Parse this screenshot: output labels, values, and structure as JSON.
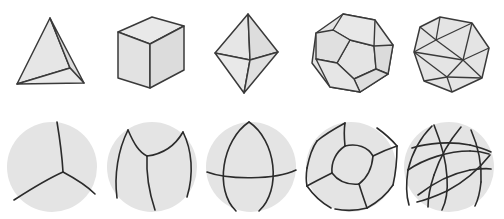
{
  "figure": {
    "background_color": "#ffffff",
    "rows": [
      {
        "name": "polyhedra-row",
        "description": "Convex regular polyhedra drawn in oblique projection",
        "items": [
          {
            "name": "tetrahedron",
            "label": "Tetrahedron",
            "faces": 4,
            "vertices": 4,
            "edges": 6,
            "face_polygon": "triangle",
            "visible_faces": 3
          },
          {
            "name": "cube",
            "label": "Cube",
            "faces": 6,
            "vertices": 8,
            "edges": 12,
            "face_polygon": "square",
            "visible_faces": 3
          },
          {
            "name": "octahedron",
            "label": "Octahedron",
            "faces": 8,
            "vertices": 6,
            "edges": 12,
            "face_polygon": "triangle",
            "visible_faces": 4
          },
          {
            "name": "dodecahedron",
            "label": "Dodecahedron",
            "faces": 12,
            "vertices": 20,
            "edges": 30,
            "face_polygon": "pentagon",
            "visible_faces": 6
          },
          {
            "name": "icosahedron",
            "label": "Icosahedron",
            "faces": 20,
            "vertices": 12,
            "edges": 30,
            "face_polygon": "triangle",
            "visible_faces": 10
          }
        ]
      },
      {
        "name": "spherical-tessellation-row",
        "description": "Radial projection of each solid onto the circumscribed sphere",
        "items": [
          {
            "name": "spherical-tetrahedron",
            "label": "Spherical tetrahedron",
            "arcs": 3,
            "description": "three great-circle arcs meeting at one visible vertex"
          },
          {
            "name": "spherical-cube",
            "label": "Spherical cube",
            "arcs": 3,
            "description": "three curved quadrilateral faces meeting at a central vertex"
          },
          {
            "name": "spherical-octahedron",
            "label": "Spherical octahedron",
            "arcs": 3,
            "description": "three mutually perpendicular great circles"
          },
          {
            "name": "spherical-dodecahedron",
            "label": "Spherical dodecahedron",
            "arcs": 11,
            "description": "curved pentagons tiling the sphere"
          },
          {
            "name": "spherical-icosahedron",
            "label": "Spherical icosahedron",
            "arcs": 9,
            "description": "curved triangles tiling the sphere"
          }
        ]
      }
    ],
    "style": {
      "face_fill": "#e3e3e3",
      "face_fill_light": "#eaeaea",
      "face_fill_dark": "#d8d8d8",
      "edge_color": "#3a3a3a",
      "sphere_fill": "#e4e4e4",
      "arc_color": "#2b2b2b",
      "edge_width": "1.4",
      "arc_width": "1.6"
    }
  }
}
